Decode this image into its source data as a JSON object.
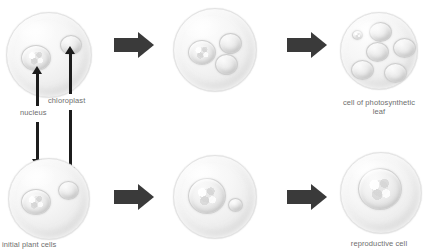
{
  "diagram": {
    "colors": {
      "arrow": "#3a3a3a",
      "label_arrow": "#1c1c1c",
      "caption_text": "#6e6e6e",
      "cell_fill": "#f2f2f2",
      "organelle_fill": "#e4e4e4",
      "background": "#ffffff"
    },
    "labels": {
      "nucleus": "nucleus",
      "chloroplast": "chloroplast",
      "initial_plant_cells": "initial plant cells",
      "photosynthetic_leaf_cell": "cell of photosynthetic leaf",
      "photosynthetic_leaf_cell_line1": "cell of photosynthetic",
      "photosynthetic_leaf_cell_line2": "leaf",
      "reproductive_cell": "reproductive cell"
    },
    "rows": [
      {
        "name": "photosynthetic-pathway",
        "stages": [
          {
            "name": "initial-plant-cell-top",
            "nuclei": 1,
            "nucleus_size": "medium",
            "chloroplasts": 1,
            "chloroplast_size": "medium"
          },
          {
            "name": "intermediate-cell-top",
            "nuclei": 1,
            "nucleus_size": "medium",
            "chloroplasts": 2,
            "chloroplast_size": "medium"
          },
          {
            "name": "photosynthetic-leaf-cell",
            "nuclei": 1,
            "nucleus_size": "small",
            "chloroplasts": 5,
            "chloroplast_size": "large"
          }
        ]
      },
      {
        "name": "reproductive-pathway",
        "stages": [
          {
            "name": "initial-plant-cell-bottom",
            "nuclei": 1,
            "nucleus_size": "medium",
            "chloroplasts": 1,
            "chloroplast_size": "medium"
          },
          {
            "name": "intermediate-cell-bottom",
            "nuclei": 1,
            "nucleus_size": "large",
            "chloroplasts": 1,
            "chloroplast_size": "small"
          },
          {
            "name": "reproductive-cell",
            "nuclei": 1,
            "nucleus_size": "extra-large",
            "chloroplasts": 0,
            "chloroplast_size": "none"
          }
        ]
      }
    ],
    "process_arrows": [
      {
        "name": "arrow-top-left",
        "direction": "right"
      },
      {
        "name": "arrow-top-right",
        "direction": "right"
      },
      {
        "name": "arrow-bottom-left",
        "direction": "right"
      },
      {
        "name": "arrow-bottom-right",
        "direction": "right"
      }
    ]
  }
}
